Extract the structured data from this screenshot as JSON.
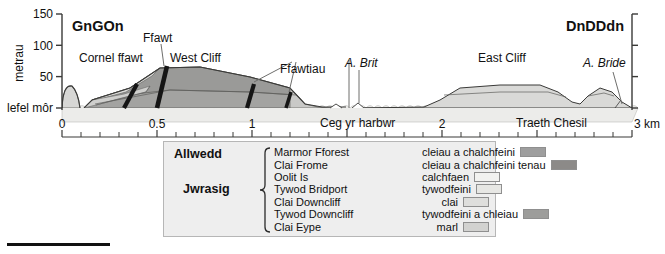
{
  "figure": {
    "yaxis": {
      "title": "metrau",
      "ticks": [
        {
          "value": 150,
          "label": "150"
        },
        {
          "value": 100,
          "label": "100"
        },
        {
          "value": 50,
          "label": "50"
        },
        {
          "value": 0,
          "label": "lefel môr"
        }
      ],
      "min": 0,
      "max": 150
    },
    "xaxis": {
      "unit_label": "3 km",
      "ticks": [
        {
          "value": 0,
          "label": "0"
        },
        {
          "value": 0.5,
          "label": "0.5"
        },
        {
          "value": 1,
          "label": "1"
        },
        {
          "value": 2,
          "label": "2"
        },
        {
          "value": 3,
          "label": "3 km"
        }
      ],
      "minor_tick_step": 0.1,
      "min": 0,
      "max": 3
    },
    "end_labels": {
      "left": "GnGOn",
      "right": "DnDDdn"
    },
    "annotations": [
      {
        "name": "fault-single",
        "text": "Ffawt",
        "style": "plain"
      },
      {
        "name": "faults-multiple",
        "text": "Ffawtiau",
        "style": "plain"
      },
      {
        "name": "corner-fault",
        "text": "Cornel ffawt",
        "style": "plain"
      },
      {
        "name": "west-cliff",
        "text": "West Cliff",
        "style": "plain"
      },
      {
        "name": "east-cliff",
        "text": "East Cliff",
        "style": "plain"
      },
      {
        "name": "harbour-mouth",
        "text": "Ceg yr harbwr",
        "style": "plain"
      },
      {
        "name": "chesil-beach",
        "text": "Traeth Chesil",
        "style": "plain"
      },
      {
        "name": "afon-brit",
        "text": "A. Brit",
        "style": "italic"
      },
      {
        "name": "afon-bride",
        "text": "A. Bride",
        "style": "italic"
      }
    ]
  },
  "legend": {
    "title": "Allwedd",
    "group_label": "Jwrasig",
    "rows": [
      {
        "name": "Marmor Fforest",
        "description": "cleiau a chalchfeini",
        "color": "#9e9e9e"
      },
      {
        "name": "Clai Frome",
        "description": "cleiau a chalchfeini tenau",
        "color": "#8c8a88"
      },
      {
        "name": "Oolit Is",
        "description": "calchfaen",
        "color": "#f2f2f0"
      },
      {
        "name": "Tywod Bridport",
        "description": "tywodfeini",
        "color": "#e7e7e4"
      },
      {
        "name": "Clai Downcliff",
        "description": "clai",
        "color": "#dededc"
      },
      {
        "name": "Tywod Downcliff",
        "description": "tywodfeini a chleiau",
        "color": "#9d9d9b"
      },
      {
        "name": "Clai Eype",
        "description": "marl",
        "color": "#d2d2d0"
      }
    ]
  },
  "colors": {
    "background": "#ffffff",
    "legend_background": "#eeeeee",
    "legend_border": "#b6b6b6",
    "fault_line": "#1a1a1a",
    "sea": "#f0f0ee",
    "beach": "#dcdcda",
    "outline": "#4a4a4a"
  }
}
